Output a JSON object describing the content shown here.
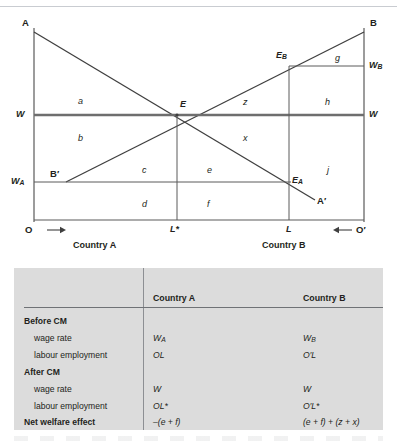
{
  "chart": {
    "axis_labels": {
      "A": "A",
      "B": "B",
      "A_prime": "A′",
      "B_prime": "B′",
      "W_left": "W",
      "W_right": "W",
      "W_A": "W",
      "W_A_sub": "A",
      "W_B": "W",
      "W_B_sub": "B",
      "O": "O",
      "O_prime": "O′",
      "L_star": "L*",
      "L": "L",
      "E": "E",
      "E_A": "E",
      "E_A_sub": "A",
      "E_B": "E",
      "E_B_sub": "B"
    },
    "country_a": "Country A",
    "country_b": "Country B",
    "areas": [
      "a",
      "b",
      "c",
      "d",
      "e",
      "f",
      "g",
      "h",
      "j",
      "x",
      "z"
    ],
    "colors": {
      "line": "#3f3f3f",
      "wage_line": "#6e6e6e",
      "axis": "#5a5a5a"
    }
  },
  "table": {
    "corner": "",
    "columns": [
      "Country A",
      "Country B"
    ],
    "rows": [
      {
        "label": "Before CM",
        "type": "group",
        "a": "",
        "b": ""
      },
      {
        "label": "wage rate",
        "type": "sub",
        "a": "W",
        "a_sub": "A",
        "b": "W",
        "b_sub": "B"
      },
      {
        "label": "labour employment",
        "type": "sub",
        "a": "OL",
        "b": "O′L"
      },
      {
        "label": "After CM",
        "type": "group",
        "a": "",
        "b": ""
      },
      {
        "label": "wage rate",
        "type": "sub",
        "a": "W",
        "b": "W"
      },
      {
        "label": "labour employment",
        "type": "sub",
        "a": "OL*",
        "b": "O′L*"
      },
      {
        "label": "Net welfare effect",
        "type": "net",
        "a": "–(e + f)",
        "b": "(e + f) + (z + x)"
      }
    ]
  }
}
